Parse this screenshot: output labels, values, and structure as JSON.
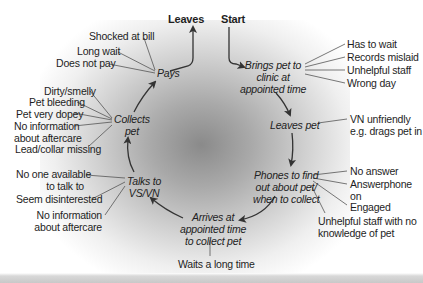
{
  "diagram": {
    "type": "client-journey-cycle",
    "start_label": "Start",
    "end_label": "Leaves",
    "stages": [
      {
        "label": "Brings pet to clinic at appointed time",
        "lines": [
          "Brings pet to",
          "clinic at",
          "appointed time"
        ]
      },
      {
        "label": "Leaves pet",
        "lines": [
          "Leaves pet"
        ]
      },
      {
        "label": "Phones to find out about pet/ when to collect",
        "lines": [
          "Phones to find",
          "out about pet/",
          "when to collect"
        ]
      },
      {
        "label": "Arrives at appointed time to collect pet",
        "lines": [
          "Arrives at",
          "appointed time",
          "to collect pet"
        ]
      },
      {
        "label": "Talks to VS/VN",
        "lines": [
          "Talks to",
          "VS/VN"
        ]
      },
      {
        "label": "Collects pet",
        "lines": [
          "Collects",
          "pet"
        ]
      },
      {
        "label": "Pays",
        "lines": [
          "Pays"
        ]
      }
    ],
    "issues": {
      "brings_pet": [
        "Has to wait",
        "Records mislaid",
        "Unhelpful staff",
        "Wrong day"
      ],
      "leaves_pet": [
        {
          "lines": [
            "VN unfriendly",
            "e.g. drags pet in"
          ]
        }
      ],
      "phones": [
        {
          "lines": [
            "No answer"
          ]
        },
        {
          "lines": [
            "Answerphone",
            "on"
          ]
        },
        {
          "lines": [
            "Engaged"
          ]
        },
        {
          "lines": [
            "Unhelpful staff with no",
            "knowledge of pet"
          ]
        }
      ],
      "arrives": [
        "Waits a long time"
      ],
      "talks": [
        {
          "lines": [
            "No one available",
            "to talk to"
          ]
        },
        {
          "lines": [
            "Seem disinterested"
          ]
        },
        {
          "lines": [
            "No information",
            "about aftercare"
          ]
        }
      ],
      "collects": [
        {
          "lines": [
            "Dirty/smelly"
          ]
        },
        {
          "lines": [
            "Pet bleeding"
          ]
        },
        {
          "lines": [
            "Pet very dopey"
          ]
        },
        {
          "lines": [
            "No information",
            "about aftercare"
          ]
        },
        {
          "lines": [
            "Lead/collar missing"
          ]
        }
      ],
      "pays": [
        "Shocked at bill",
        "Long wait",
        "Does not pay"
      ]
    }
  }
}
